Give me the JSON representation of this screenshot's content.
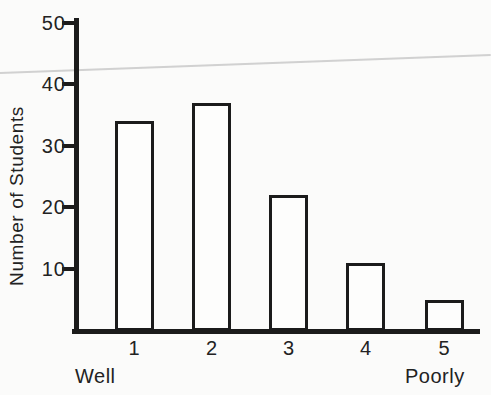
{
  "figure": {
    "background": "#fbfbfa",
    "ink_color": "#1b1b1b",
    "artifact_line_color": "#c9c9c9"
  },
  "chart_data": {
    "type": "bar",
    "title": "",
    "categories": [
      "1",
      "2",
      "3",
      "4",
      "5"
    ],
    "values": [
      34,
      37,
      22,
      11,
      5
    ],
    "ylabel": "Number of Students",
    "xlabel": "",
    "xlabel_left": "Well",
    "xlabel_right": "Poorly",
    "ylim": [
      0,
      50
    ],
    "yticks": [
      10,
      20,
      30,
      40,
      50
    ],
    "grid": false,
    "legend": "none",
    "bar_fill": "#fdfdfc",
    "bar_border": "#1b1b1b"
  }
}
